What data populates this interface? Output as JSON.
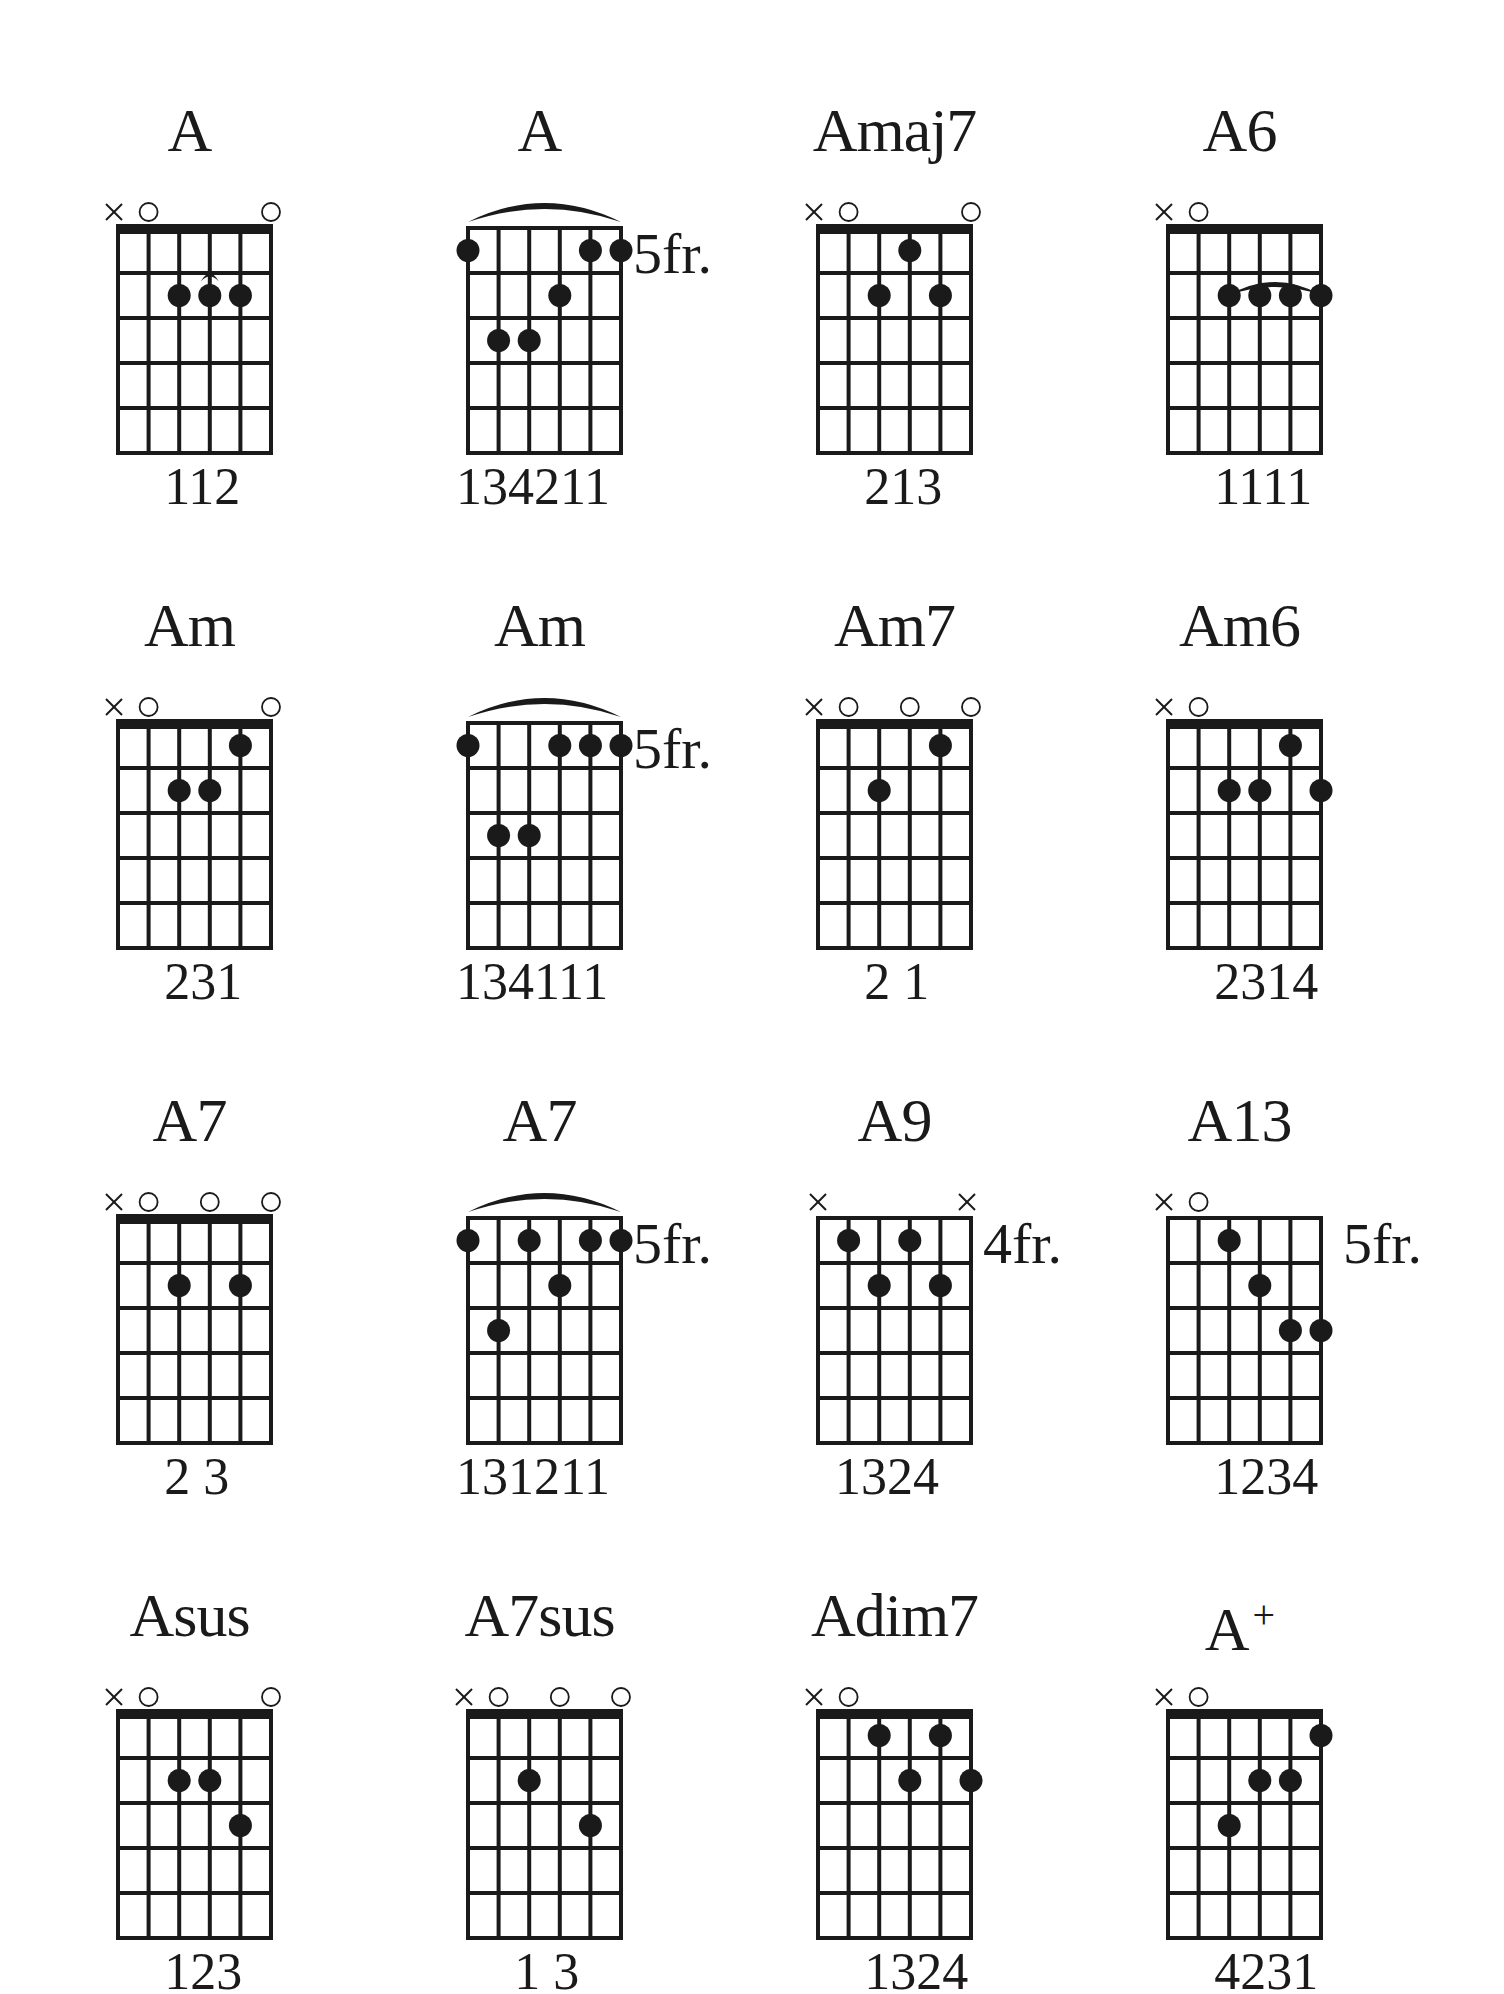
{
  "page": {
    "background": "#ffffff",
    "ink": "#1a1a1a"
  },
  "chords": [
    {
      "name": "A",
      "suffix": "",
      "col": 0,
      "row": 0,
      "fret_label": "",
      "nut": true,
      "markers": [
        "x",
        "o",
        "",
        "",
        "",
        "o"
      ],
      "dots": [
        [
          2,
          2
        ],
        [
          3,
          2
        ],
        [
          4,
          2
        ]
      ],
      "barre": {
        "from": 2,
        "to": 4,
        "fret": 2,
        "small": true
      },
      "fingering": "112",
      "fingering_offset": 2
    },
    {
      "name": "A",
      "suffix": "",
      "col": 1,
      "row": 0,
      "fret_label": "5fr.",
      "nut": false,
      "markers": [
        "",
        "",
        "",
        "",
        "",
        ""
      ],
      "dots": [
        [
          0,
          1
        ],
        [
          4,
          1
        ],
        [
          5,
          1
        ],
        [
          3,
          2
        ],
        [
          1,
          3
        ],
        [
          2,
          3
        ]
      ],
      "barre": {
        "from": 0,
        "to": 5,
        "fret": 1,
        "small": false
      },
      "fingering": "134211",
      "fingering_offset": 0
    },
    {
      "name": "Amaj7",
      "suffix": "",
      "col": 2,
      "row": 0,
      "fret_label": "",
      "nut": true,
      "markers": [
        "x",
        "o",
        "",
        "",
        "",
        "o"
      ],
      "dots": [
        [
          3,
          1
        ],
        [
          2,
          2
        ],
        [
          4,
          2
        ]
      ],
      "barre": null,
      "fingering": "213",
      "fingering_offset": 2
    },
    {
      "name": "A6",
      "suffix": "",
      "col": 3,
      "row": 0,
      "fret_label": "",
      "nut": true,
      "markers": [
        "x",
        "o",
        "",
        "",
        "",
        ""
      ],
      "dots": [
        [
          2,
          2
        ],
        [
          3,
          2
        ],
        [
          4,
          2
        ],
        [
          5,
          2
        ]
      ],
      "barre": {
        "from": 2,
        "to": 5,
        "fret": 2,
        "small": false
      },
      "fingering": "1111",
      "fingering_offset": 2
    },
    {
      "name": "Am",
      "suffix": "",
      "col": 0,
      "row": 1,
      "fret_label": "",
      "nut": true,
      "markers": [
        "x",
        "o",
        "",
        "",
        "",
        "o"
      ],
      "dots": [
        [
          4,
          1
        ],
        [
          2,
          2
        ],
        [
          3,
          2
        ]
      ],
      "barre": null,
      "fingering": "231",
      "fingering_offset": 2
    },
    {
      "name": "Am",
      "suffix": "",
      "col": 1,
      "row": 1,
      "fret_label": "5fr.",
      "nut": false,
      "markers": [
        "",
        "",
        "",
        "",
        "",
        ""
      ],
      "dots": [
        [
          0,
          1
        ],
        [
          3,
          1
        ],
        [
          4,
          1
        ],
        [
          5,
          1
        ],
        [
          1,
          3
        ],
        [
          2,
          3
        ]
      ],
      "barre": {
        "from": 0,
        "to": 5,
        "fret": 1,
        "small": false
      },
      "fingering": "134111",
      "fingering_offset": 0
    },
    {
      "name": "Am7",
      "suffix": "",
      "col": 2,
      "row": 1,
      "fret_label": "",
      "nut": true,
      "markers": [
        "x",
        "o",
        "",
        "o",
        "",
        "o"
      ],
      "dots": [
        [
          4,
          1
        ],
        [
          2,
          2
        ]
      ],
      "barre": null,
      "fingering": "2 1",
      "fingering_offset": 2
    },
    {
      "name": "Am6",
      "suffix": "",
      "col": 3,
      "row": 1,
      "fret_label": "",
      "nut": true,
      "markers": [
        "x",
        "o",
        "",
        "",
        "",
        ""
      ],
      "dots": [
        [
          4,
          1
        ],
        [
          2,
          2
        ],
        [
          3,
          2
        ],
        [
          5,
          2
        ]
      ],
      "barre": null,
      "fingering": "2314",
      "fingering_offset": 2
    },
    {
      "name": "A7",
      "suffix": "",
      "col": 0,
      "row": 2,
      "fret_label": "",
      "nut": true,
      "markers": [
        "x",
        "o",
        "",
        "o",
        "",
        "o"
      ],
      "dots": [
        [
          2,
          2
        ],
        [
          4,
          2
        ]
      ],
      "barre": null,
      "fingering": "2 3",
      "fingering_offset": 2
    },
    {
      "name": "A7",
      "suffix": "",
      "col": 1,
      "row": 2,
      "fret_label": "5fr.",
      "nut": false,
      "markers": [
        "",
        "",
        "",
        "",
        "",
        ""
      ],
      "dots": [
        [
          0,
          1
        ],
        [
          2,
          1
        ],
        [
          4,
          1
        ],
        [
          5,
          1
        ],
        [
          3,
          2
        ],
        [
          1,
          3
        ]
      ],
      "barre": {
        "from": 0,
        "to": 5,
        "fret": 1,
        "small": false
      },
      "fingering": "131211",
      "fingering_offset": 0
    },
    {
      "name": "A9",
      "suffix": "",
      "col": 2,
      "row": 2,
      "fret_label": "4fr.",
      "nut": false,
      "markers": [
        "x",
        "",
        "",
        "",
        "",
        "x"
      ],
      "dots": [
        [
          1,
          1
        ],
        [
          3,
          1
        ],
        [
          2,
          2
        ],
        [
          4,
          2
        ]
      ],
      "barre": null,
      "fingering": "1324",
      "fingering_offset": 1
    },
    {
      "name": "A13",
      "suffix": "",
      "col": 3,
      "row": 2,
      "fret_label": "5fr.",
      "nut": false,
      "markers": [
        "x",
        "o",
        "",
        "",
        "",
        ""
      ],
      "dots": [
        [
          2,
          1
        ],
        [
          3,
          2
        ],
        [
          4,
          3
        ],
        [
          5,
          3
        ]
      ],
      "barre": null,
      "fingering": "1234",
      "fingering_offset": 2
    },
    {
      "name": "Asus",
      "suffix": "",
      "col": 0,
      "row": 3,
      "fret_label": "",
      "nut": true,
      "markers": [
        "x",
        "o",
        "",
        "",
        "",
        "o"
      ],
      "dots": [
        [
          2,
          2
        ],
        [
          3,
          2
        ],
        [
          4,
          3
        ]
      ],
      "barre": null,
      "fingering": "123",
      "fingering_offset": 2
    },
    {
      "name": "A7sus",
      "suffix": "",
      "col": 1,
      "row": 3,
      "fret_label": "",
      "nut": true,
      "markers": [
        "x",
        "o",
        "",
        "o",
        "",
        "o"
      ],
      "dots": [
        [
          2,
          2
        ],
        [
          4,
          3
        ]
      ],
      "barre": null,
      "fingering": "1 3",
      "fingering_offset": 2
    },
    {
      "name": "Adim7",
      "suffix": "",
      "col": 2,
      "row": 3,
      "fret_label": "",
      "nut": true,
      "markers": [
        "x",
        "o",
        "",
        "",
        "",
        ""
      ],
      "dots": [
        [
          2,
          1
        ],
        [
          4,
          1
        ],
        [
          3,
          2
        ],
        [
          5,
          2
        ]
      ],
      "barre": null,
      "fingering": "1324",
      "fingering_offset": 2
    },
    {
      "name": "A",
      "suffix": "+",
      "col": 3,
      "row": 3,
      "fret_label": "",
      "nut": true,
      "markers": [
        "x",
        "o",
        "",
        "",
        "",
        ""
      ],
      "dots": [
        [
          5,
          1
        ],
        [
          3,
          2
        ],
        [
          4,
          2
        ],
        [
          2,
          3
        ]
      ],
      "barre": null,
      "fingering": "4231",
      "fingering_offset": 2
    }
  ],
  "chart_data": {
    "type": "table",
    "columns": 4,
    "rows": 4,
    "strings": 6,
    "frets_shown": 5,
    "entries": [
      {
        "chord": "A",
        "position": "open",
        "fingering": "112"
      },
      {
        "chord": "A",
        "position": "5fr.",
        "fingering": "134211"
      },
      {
        "chord": "Amaj7",
        "position": "open",
        "fingering": "213"
      },
      {
        "chord": "A6",
        "position": "open",
        "fingering": "1111"
      },
      {
        "chord": "Am",
        "position": "open",
        "fingering": "231"
      },
      {
        "chord": "Am",
        "position": "5fr.",
        "fingering": "134111"
      },
      {
        "chord": "Am7",
        "position": "open",
        "fingering": "2 1"
      },
      {
        "chord": "Am6",
        "position": "open",
        "fingering": "2314"
      },
      {
        "chord": "A7",
        "position": "open",
        "fingering": "2 3"
      },
      {
        "chord": "A7",
        "position": "5fr.",
        "fingering": "131211"
      },
      {
        "chord": "A9",
        "position": "4fr.",
        "fingering": "1324"
      },
      {
        "chord": "A13",
        "position": "5fr.",
        "fingering": "1234"
      },
      {
        "chord": "Asus",
        "position": "open",
        "fingering": "123"
      },
      {
        "chord": "A7sus",
        "position": "open",
        "fingering": "1 3"
      },
      {
        "chord": "Adim7",
        "position": "open",
        "fingering": "1324"
      },
      {
        "chord": "A+",
        "position": "open",
        "fingering": "4231"
      }
    ]
  }
}
